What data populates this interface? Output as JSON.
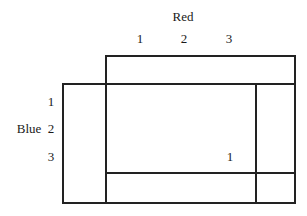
{
  "column_player": {
    "label": "Red",
    "columns": [
      "1",
      "2",
      "3"
    ]
  },
  "row_player": {
    "label": "Blue",
    "rows": [
      "1",
      "2",
      "3"
    ]
  },
  "cells": [
    {
      "row": "3",
      "col": "3",
      "value": "1"
    }
  ],
  "colors": {
    "line": "#222222",
    "text": "#1a1a1a",
    "background": "#ffffff"
  }
}
